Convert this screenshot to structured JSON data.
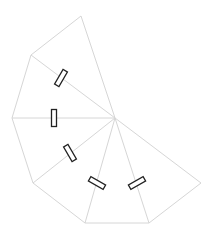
{
  "diagram": {
    "type": "triangle-fan",
    "center": [
      115,
      118
    ],
    "outer_vertices": [
      [
        81,
        16
      ],
      [
        31,
        55
      ],
      [
        12,
        118
      ],
      [
        33,
        183
      ],
      [
        85,
        223
      ],
      [
        149,
        223
      ],
      [
        201,
        183
      ]
    ],
    "triangle_count": 6,
    "colors": {
      "edge": "#d6d6d6",
      "hinge_stroke": "#222222",
      "background": "#ffffff"
    },
    "hinges": [
      {
        "cx": 61,
        "cy": 78,
        "w": 5,
        "h": 17,
        "rotate": 30
      },
      {
        "cx": 54,
        "cy": 118,
        "w": 5,
        "h": 17,
        "rotate": 0
      },
      {
        "cx": 70,
        "cy": 153,
        "w": 5,
        "h": 17,
        "rotate": -30
      },
      {
        "cx": 97,
        "cy": 183,
        "w": 5,
        "h": 17,
        "rotate": -60
      },
      {
        "cx": 137,
        "cy": 183,
        "w": 5,
        "h": 17,
        "rotate": 60
      }
    ]
  }
}
